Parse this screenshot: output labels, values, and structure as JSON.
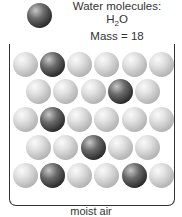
{
  "legend": {
    "title": "Water molecules:",
    "formula_main": "H",
    "formula_sub": "2",
    "formula_end": "O",
    "mass": "Mass = 18"
  },
  "caption": "moist air",
  "colors": {
    "light_molecule": "#c8c8c8",
    "dark_molecule": "#2a2a2a",
    "outline": "#333333"
  },
  "grid": {
    "rows": [
      [
        "light",
        "dark",
        "light",
        "light",
        "light",
        "light"
      ],
      [
        "light",
        "light",
        "light",
        "dark",
        "light"
      ],
      [
        "light",
        "dark",
        "light",
        "light",
        "light",
        "light"
      ],
      [
        "light",
        "light",
        "dark",
        "light",
        "light"
      ],
      [
        "light",
        "dark",
        "light",
        "light",
        "dark",
        "light"
      ]
    ]
  }
}
